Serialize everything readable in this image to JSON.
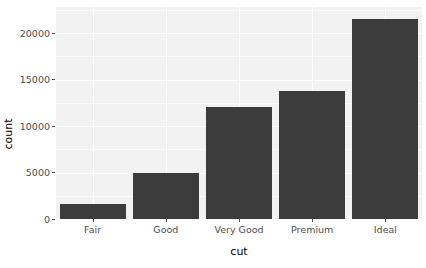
{
  "chart_data": {
    "type": "bar",
    "title": "",
    "subtitle": "",
    "xlabel": "cut",
    "ylabel": "count",
    "categories": [
      "Fair",
      "Good",
      "Very Good",
      "Premium",
      "Ideal"
    ],
    "values": [
      1610,
      4906,
      12082,
      13791,
      21551
    ],
    "series": [
      {
        "name": "count",
        "values": [
          1610,
          4906,
          12082,
          13791,
          21551
        ]
      }
    ],
    "ylim": [
      0,
      22800
    ],
    "yticks": [
      0,
      5000,
      10000,
      15000,
      20000
    ],
    "ytick_labels": [
      "0",
      "5000",
      "10000",
      "15000",
      "20000"
    ],
    "xtick_labels": [
      "Fair",
      "Good",
      "Very Good",
      "Premium",
      "Ideal"
    ],
    "grid": true,
    "legend": null,
    "legend_position": "none",
    "annotations": [],
    "colors": {
      "bar_fill": "#3c3c3c",
      "panel_background": "#f2f2f2",
      "grid_major": "#ffffff",
      "grid_minor": "#fbfbfb",
      "plot_background": "#ffffff",
      "axis_text": "#4d4d4d",
      "axis_title": "#000000"
    }
  }
}
